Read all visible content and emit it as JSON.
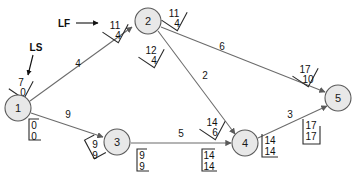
{
  "diagram": {
    "legend": {
      "ls_label": "LS",
      "lf_label": "LF"
    },
    "nodes": [
      {
        "id": "1",
        "label": "1",
        "cx": 18,
        "cy": 108
      },
      {
        "id": "2",
        "label": "2",
        "cx": 148,
        "cy": 21
      },
      {
        "id": "3",
        "label": "3",
        "cx": 117,
        "cy": 142
      },
      {
        "id": "4",
        "label": "4",
        "cx": 245,
        "cy": 143
      },
      {
        "id": "5",
        "label": "5",
        "cx": 338,
        "cy": 98
      }
    ],
    "edges": [
      {
        "from": "1",
        "to": "2",
        "weight": "4"
      },
      {
        "from": "1",
        "to": "3",
        "weight": "9"
      },
      {
        "from": "2",
        "to": "4",
        "weight": "2"
      },
      {
        "from": "2",
        "to": "5",
        "weight": "6"
      },
      {
        "from": "3",
        "to": "4",
        "weight": "5"
      },
      {
        "from": "4",
        "to": "5",
        "weight": "3"
      }
    ],
    "time_boxes": [
      {
        "name": "edge-1-2-tail",
        "top": "7",
        "bottom": "0",
        "rotation": -62
      },
      {
        "name": "edge-1-2-head",
        "top": "11",
        "bottom": "4",
        "rotation": -62
      },
      {
        "name": "edge-2-5-tail",
        "top": "11",
        "bottom": "4",
        "rotation": -62
      },
      {
        "name": "edge-2-5-head",
        "top": "17",
        "bottom": "10",
        "rotation": -62
      },
      {
        "name": "edge-2-4-tail",
        "top": "12",
        "bottom": "4",
        "rotation": -62
      },
      {
        "name": "edge-2-4-head",
        "top": "14",
        "bottom": "6",
        "rotation": -62
      },
      {
        "name": "edge-1-3-tail",
        "top": "0",
        "bottom": "0",
        "rotation": 0
      },
      {
        "name": "edge-1-3-head",
        "top": "9",
        "bottom": "9",
        "rotation": -28
      },
      {
        "name": "edge-3-4-tail",
        "top": "9",
        "bottom": "9",
        "rotation": 0
      },
      {
        "name": "edge-3-4-head",
        "top": "14",
        "bottom": "14",
        "rotation": 0
      },
      {
        "name": "edge-4-5-tail",
        "top": "14",
        "bottom": "14",
        "rotation": 0
      },
      {
        "name": "edge-4-5-head",
        "top": "17",
        "bottom": "17",
        "rotation": 0
      }
    ],
    "colors": {
      "node_fill": "#e8e8e8",
      "node_stroke": "#5a5a5a",
      "edge_stroke": "#6b6b6b",
      "text": "#101010",
      "background": "#ffffff"
    }
  }
}
